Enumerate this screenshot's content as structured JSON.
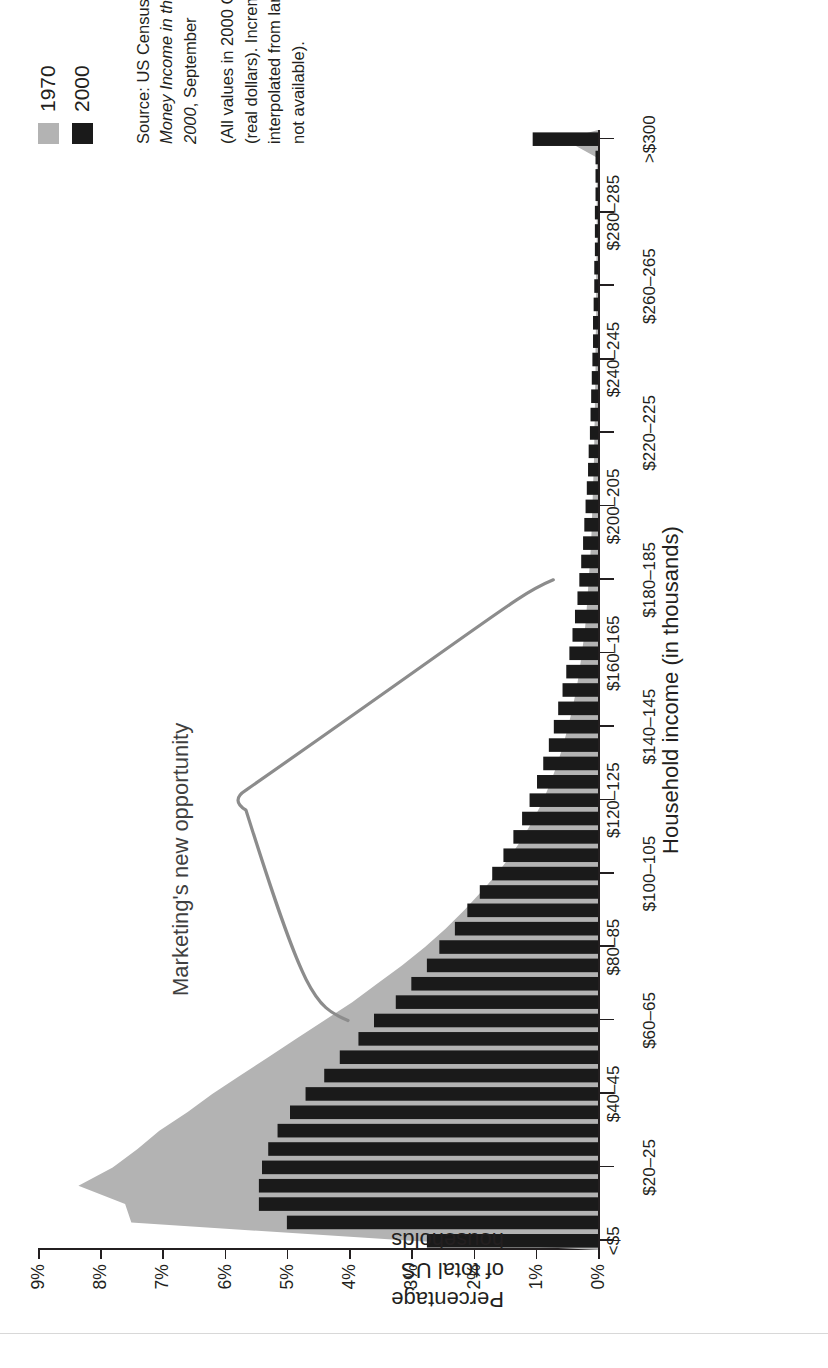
{
  "legend": {
    "items": [
      {
        "label": "1970",
        "color": "#b3b3b3"
      },
      {
        "label": "2000",
        "color": "#1a1a1a"
      }
    ]
  },
  "source": {
    "line1_prefix": "Source: US Census Bureau (2001) ",
    "line1_italic": "Money Income in the United States: 2000",
    "line1_suffix": ", September",
    "note": "(All values in 2000 CPI-U-RS dollars (real dollars). Incremental values interpolated from larger increments when not available)."
  },
  "annotation": {
    "label": "Marketing's new opportunity",
    "span_start_category": "$60–65",
    "span_end_category": "$180–185"
  },
  "chart_data": {
    "type": "bar",
    "title": "",
    "xlabel": "Household income (in thousands)",
    "ylabel": "Percentage of total US households",
    "ylim": [
      0,
      9
    ],
    "ytick_labels": [
      "0%",
      "1%",
      "2%",
      "3%",
      "4%",
      "5%",
      "6%",
      "7%",
      "8%",
      "9%"
    ],
    "ytick_values": [
      0,
      1,
      2,
      3,
      4,
      5,
      6,
      7,
      8,
      9
    ],
    "grid": false,
    "legend_position": "top-right",
    "categories": [
      "<$5",
      "$5–10",
      "$10–15",
      "$15–20",
      "$20–25",
      "$25–30",
      "$30–35",
      "$35–40",
      "$40–45",
      "$45–50",
      "$50–55",
      "$55–60",
      "$60–65",
      "$65–70",
      "$70–75",
      "$75–80",
      "$80–85",
      "$85–90",
      "$90–95",
      "$95–100",
      "$100–105",
      "$105–110",
      "$110–115",
      "$115–120",
      "$120–125",
      "$125–130",
      "$130–135",
      "$135–140",
      "$140–145",
      "$145–150",
      "$150–155",
      "$155–160",
      "$160–165",
      "$165–170",
      "$170–175",
      "$175–180",
      "$180–185",
      "$185–190",
      "$190–195",
      "$195–200",
      "$200–205",
      "$205–210",
      "$210–215",
      "$215–220",
      "$220–225",
      "$225–230",
      "$230–235",
      "$235–240",
      "$240–245",
      "$245–250",
      "$250–255",
      "$255–260",
      "$260–265",
      "$265–270",
      "$270–275",
      "$275–280",
      "$280–285",
      "$285–290",
      "$290–295",
      "$295–300",
      ">$300"
    ],
    "xtick_labels_shown": [
      "<$5",
      "$20–25",
      "$40–45",
      "$60–65",
      "$80–85",
      "$100–105",
      "$120–125",
      "$140–145",
      "$160–165",
      "$180–185",
      "$200–205",
      "$220–225",
      "$240–245",
      "$260–265",
      "$280–285",
      ">$300"
    ],
    "series": [
      {
        "name": "1970",
        "kind": "area",
        "color": "#b3b3b3",
        "values": [
          3.0,
          7.5,
          7.6,
          8.35,
          7.8,
          7.4,
          7.05,
          6.6,
          6.2,
          5.75,
          5.3,
          4.85,
          4.4,
          3.95,
          3.55,
          3.15,
          2.78,
          2.45,
          2.15,
          1.88,
          1.62,
          1.4,
          1.2,
          1.03,
          0.88,
          0.76,
          0.65,
          0.56,
          0.48,
          0.41,
          0.35,
          0.3,
          0.26,
          0.22,
          0.19,
          0.17,
          0.15,
          0.13,
          0.11,
          0.1,
          0.09,
          0.08,
          0.07,
          0.06,
          0.06,
          0.05,
          0.05,
          0.04,
          0.04,
          0.04,
          0.03,
          0.03,
          0.03,
          0.03,
          0.02,
          0.02,
          0.02,
          0.02,
          0.02,
          0.02,
          0.55
        ]
      },
      {
        "name": "2000",
        "kind": "bar",
        "color": "#1a1a1a",
        "values": [
          2.75,
          5.0,
          5.45,
          5.45,
          5.4,
          5.3,
          5.15,
          4.95,
          4.7,
          4.4,
          4.15,
          3.85,
          3.6,
          3.25,
          3.0,
          2.75,
          2.55,
          2.3,
          2.1,
          1.9,
          1.7,
          1.52,
          1.36,
          1.22,
          1.1,
          0.98,
          0.88,
          0.79,
          0.71,
          0.64,
          0.57,
          0.51,
          0.46,
          0.41,
          0.37,
          0.33,
          0.3,
          0.27,
          0.24,
          0.22,
          0.2,
          0.18,
          0.16,
          0.15,
          0.13,
          0.12,
          0.11,
          0.1,
          0.09,
          0.08,
          0.08,
          0.07,
          0.06,
          0.06,
          0.05,
          0.05,
          0.05,
          0.04,
          0.04,
          0.04,
          1.05
        ]
      }
    ]
  }
}
